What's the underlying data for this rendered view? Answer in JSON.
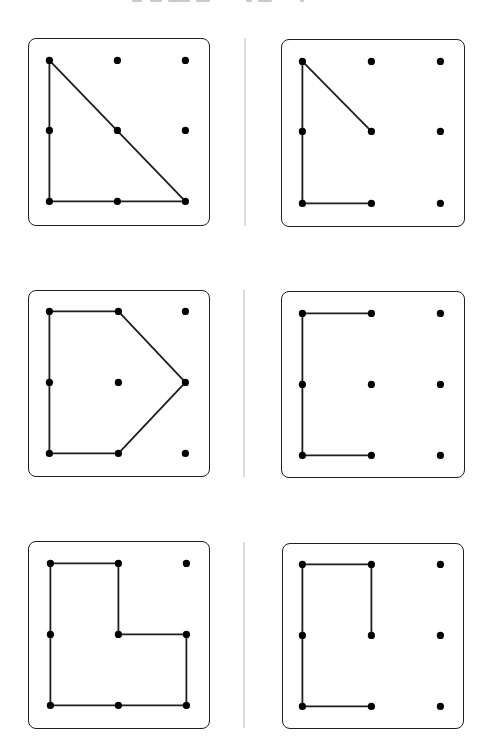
{
  "figure": {
    "title_clipped": true,
    "title_fragments": [
      {
        "x": 132,
        "w": 10
      },
      {
        "x": 150,
        "w": 12
      },
      {
        "x": 168,
        "w": 22
      },
      {
        "x": 196,
        "w": 14
      },
      {
        "x": 246,
        "w": 6
      },
      {
        "x": 258,
        "w": 14
      },
      {
        "x": 300,
        "w": 4
      }
    ],
    "colors": {
      "line": "#1e1e1e",
      "dot": "#000000",
      "border": "#1e1e1e",
      "separator": "#dcdcdc",
      "background": "#ffffff"
    },
    "grid": {
      "rows": 3,
      "cols": 3,
      "description": "3x3 geoboard pegs; coordinates given as [col,row] with origin at top-left peg"
    },
    "separators": [
      {
        "x": 244,
        "y": 38,
        "h": 188
      },
      {
        "x": 243,
        "y": 290,
        "h": 187
      },
      {
        "x": 243,
        "y": 542,
        "h": 186
      }
    ],
    "panels": [
      {
        "id": "panel-1",
        "position": "row1-left",
        "box": {
          "x": 28,
          "y": 38,
          "w": 182,
          "h": 188
        },
        "peg_x": [
          50,
          118,
          186
        ],
        "peg_y": [
          61,
          131,
          202
        ],
        "shape": "right triangle",
        "closed": true,
        "path": [
          [
            0,
            0
          ],
          [
            0,
            2
          ],
          [
            2,
            2
          ],
          [
            0,
            0
          ]
        ]
      },
      {
        "id": "panel-2",
        "position": "row1-right",
        "box": {
          "x": 281,
          "y": 39,
          "w": 184,
          "h": 188
        },
        "peg_x": [
          303,
          372,
          441
        ],
        "peg_y": [
          62,
          132,
          204
        ],
        "shape": "open polyline",
        "closed": false,
        "path": [
          [
            1,
            1
          ],
          [
            0,
            0
          ],
          [
            0,
            2
          ],
          [
            1,
            2
          ]
        ]
      },
      {
        "id": "panel-3",
        "position": "row2-left",
        "box": {
          "x": 28,
          "y": 290,
          "w": 182,
          "h": 187
        },
        "peg_x": [
          50,
          119,
          186
        ],
        "peg_y": [
          312,
          383,
          454
        ],
        "shape": "pentagon",
        "closed": true,
        "path": [
          [
            0,
            0
          ],
          [
            1,
            0
          ],
          [
            2,
            1
          ],
          [
            1,
            2
          ],
          [
            0,
            2
          ],
          [
            0,
            0
          ]
        ]
      },
      {
        "id": "panel-4",
        "position": "row2-right",
        "box": {
          "x": 281,
          "y": 291,
          "w": 184,
          "h": 187
        },
        "peg_x": [
          303,
          372,
          441
        ],
        "peg_y": [
          314,
          385,
          456
        ],
        "shape": "open bracket",
        "closed": false,
        "path": [
          [
            1,
            0
          ],
          [
            0,
            0
          ],
          [
            0,
            2
          ],
          [
            1,
            2
          ]
        ]
      },
      {
        "id": "panel-5",
        "position": "row3-left",
        "box": {
          "x": 28,
          "y": 541,
          "w": 182,
          "h": 188
        },
        "peg_x": [
          51,
          119,
          187
        ],
        "peg_y": [
          564,
          635,
          706
        ],
        "shape": "L-shaped hexagon",
        "closed": true,
        "path": [
          [
            0,
            0
          ],
          [
            1,
            0
          ],
          [
            1,
            1
          ],
          [
            2,
            1
          ],
          [
            2,
            2
          ],
          [
            1,
            2
          ],
          [
            0,
            2
          ],
          [
            0,
            1
          ],
          [
            0,
            0
          ]
        ]
      },
      {
        "id": "panel-6",
        "position": "row3-right",
        "box": {
          "x": 282,
          "y": 543,
          "w": 182,
          "h": 186
        },
        "peg_x": [
          303,
          372,
          441
        ],
        "peg_y": [
          565,
          636,
          707
        ],
        "shape": "open polyline",
        "closed": false,
        "path": [
          [
            1,
            1
          ],
          [
            1,
            0
          ],
          [
            0,
            0
          ],
          [
            0,
            2
          ],
          [
            1,
            2
          ]
        ]
      }
    ]
  }
}
